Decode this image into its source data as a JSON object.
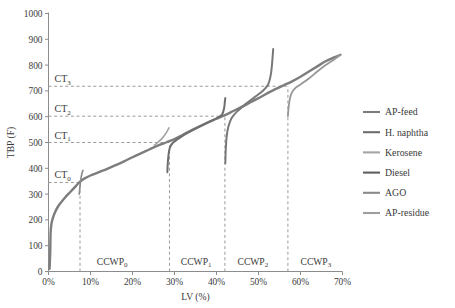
{
  "chart_data": {
    "type": "line",
    "title": "",
    "xlabel": "LV (%)",
    "ylabel": "TBP (F)",
    "xlim": [
      0,
      70
    ],
    "ylim": [
      0,
      1000
    ],
    "grid": false,
    "legend_position": "right",
    "x_ticks": [
      "0%",
      "10%",
      "20%",
      "30%",
      "40%",
      "50%",
      "60%",
      "70%"
    ],
    "x_tick_values": [
      0,
      10,
      20,
      30,
      40,
      50,
      60,
      70
    ],
    "y_ticks": [
      "0",
      "100",
      "200",
      "300",
      "400",
      "500",
      "600",
      "700",
      "800",
      "900",
      "1000"
    ],
    "y_tick_values": [
      0,
      100,
      200,
      300,
      400,
      500,
      600,
      700,
      800,
      900,
      1000
    ],
    "annotations": {
      "cut_temperatures": [
        {
          "id": "CT0",
          "base": "CT",
          "sub": "0",
          "value": 345,
          "at_lv": 7.5
        },
        {
          "id": "CT1",
          "base": "CT",
          "sub": "1",
          "value": 500,
          "at_lv": 28.8
        },
        {
          "id": "CT2",
          "base": "CT",
          "sub": "2",
          "value": 602,
          "at_lv": 42.0
        },
        {
          "id": "CT3",
          "base": "CT",
          "sub": "3",
          "value": 718,
          "at_lv": 57.0
        }
      ],
      "cut_points": [
        {
          "id": "CCWP0",
          "base": "CCWP",
          "sub": "0",
          "lv": 7.5,
          "label_lv": 11.5
        },
        {
          "id": "CCWP1",
          "base": "CCWP",
          "sub": "1",
          "lv": 28.8,
          "label_lv": 31.5
        },
        {
          "id": "CCWP2",
          "base": "CCWP",
          "sub": "2",
          "lv": 42.0,
          "label_lv": 45.0
        },
        {
          "id": "CCWP3",
          "base": "CCWP",
          "sub": "3",
          "lv": 57.0,
          "label_lv": 60.0
        }
      ]
    },
    "series": [
      {
        "name": "AP-feed",
        "color": "#7d7d7d",
        "width": 2.4,
        "points": [
          [
            0.25,
            10
          ],
          [
            0.4,
            70
          ],
          [
            0.5,
            150
          ],
          [
            0.7,
            185
          ],
          [
            1.0,
            205
          ],
          [
            1.5,
            228
          ],
          [
            2.2,
            250
          ],
          [
            3.0,
            268
          ],
          [
            4.0,
            288
          ],
          [
            5.0,
            305
          ],
          [
            6.0,
            322
          ],
          [
            7.0,
            340
          ],
          [
            7.5,
            348
          ],
          [
            8.5,
            360
          ],
          [
            10.0,
            372
          ],
          [
            12.0,
            385
          ],
          [
            14.0,
            398
          ],
          [
            16.0,
            412
          ],
          [
            18.0,
            427
          ],
          [
            20.0,
            443
          ],
          [
            22.0,
            458
          ],
          [
            24.0,
            473
          ],
          [
            26.0,
            488
          ],
          [
            28.0,
            500
          ],
          [
            28.8,
            505
          ],
          [
            30.0,
            513
          ],
          [
            32.0,
            530
          ],
          [
            34.0,
            547
          ],
          [
            36.0,
            563
          ],
          [
            38.0,
            578
          ],
          [
            40.0,
            592
          ],
          [
            42.0,
            606
          ],
          [
            44.0,
            622
          ],
          [
            46.0,
            638
          ],
          [
            48.0,
            655
          ],
          [
            50.0,
            672
          ],
          [
            52.0,
            690
          ],
          [
            54.0,
            707
          ],
          [
            56.0,
            722
          ],
          [
            57.0,
            729
          ],
          [
            58.0,
            737
          ],
          [
            60.0,
            755
          ],
          [
            62.0,
            775
          ],
          [
            64.0,
            795
          ],
          [
            66.0,
            815
          ],
          [
            68.0,
            830
          ],
          [
            69.5,
            840
          ]
        ]
      },
      {
        "name": "H. naphtha",
        "color": "#8a8a8a",
        "width": 1.6,
        "points": [
          [
            7.3,
            300
          ],
          [
            7.45,
            320
          ],
          [
            7.6,
            345
          ],
          [
            7.8,
            368
          ],
          [
            8.0,
            382
          ],
          [
            8.2,
            392
          ]
        ]
      },
      {
        "name": "Kerosene",
        "color": "#a5a5a5",
        "width": 1.6,
        "points": [
          [
            25.2,
            490
          ],
          [
            26.0,
            500
          ],
          [
            27.0,
            515
          ],
          [
            27.8,
            532
          ],
          [
            28.4,
            548
          ],
          [
            28.7,
            557
          ]
        ]
      },
      {
        "name": "Diesel",
        "color": "#6e6e6e",
        "width": 2.0,
        "points": [
          [
            28.3,
            385
          ],
          [
            28.4,
            420
          ],
          [
            28.6,
            455
          ],
          [
            28.9,
            480
          ],
          [
            29.5,
            497
          ],
          [
            30.5,
            510
          ],
          [
            32.0,
            527
          ],
          [
            34.0,
            545
          ],
          [
            36.0,
            562
          ],
          [
            38.0,
            578
          ],
          [
            40.0,
            594
          ],
          [
            41.3,
            608
          ],
          [
            41.8,
            632
          ],
          [
            42.0,
            660
          ],
          [
            42.1,
            672
          ]
        ]
      },
      {
        "name": "AGO",
        "color": "#787878",
        "width": 2.0,
        "points": [
          [
            42.1,
            420
          ],
          [
            42.2,
            470
          ],
          [
            42.4,
            520
          ],
          [
            42.8,
            560
          ],
          [
            43.6,
            595
          ],
          [
            45.0,
            622
          ],
          [
            47.0,
            650
          ],
          [
            49.0,
            675
          ],
          [
            51.0,
            700
          ],
          [
            52.3,
            725
          ],
          [
            52.9,
            760
          ],
          [
            53.2,
            800
          ],
          [
            53.4,
            840
          ],
          [
            53.5,
            862
          ]
        ]
      },
      {
        "name": "AP-residue",
        "color": "#969696",
        "width": 1.8,
        "points": [
          [
            57.0,
            602
          ],
          [
            57.2,
            640
          ],
          [
            57.5,
            672
          ],
          [
            58.0,
            695
          ],
          [
            58.8,
            712
          ],
          [
            60.0,
            725
          ],
          [
            62.0,
            748
          ],
          [
            64.0,
            775
          ],
          [
            66.0,
            800
          ],
          [
            68.0,
            822
          ],
          [
            69.5,
            840
          ]
        ]
      }
    ]
  },
  "legend": {
    "items": [
      {
        "label": "AP-feed",
        "color": "#7d7d7d"
      },
      {
        "label": "H. naphtha",
        "color": "#6e6e6e"
      },
      {
        "label": "Kerosene",
        "color": "#a5a5a5"
      },
      {
        "label": "Diesel",
        "color": "#5f5f5f"
      },
      {
        "label": "AGO",
        "color": "#8a8a8a"
      },
      {
        "label": "AP-residue",
        "color": "#9e9e9e"
      }
    ]
  }
}
